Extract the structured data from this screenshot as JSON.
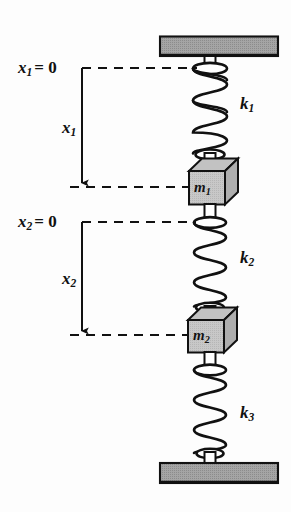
{
  "figure": {
    "colors": {
      "stroke": "#111111",
      "plate_fill": "#9d9d9d",
      "block_front_fill": "#c9c9c9",
      "block_top_fill": "#bdbdbd",
      "block_side_fill": "#a8a8a8",
      "background": "#fdfdfd"
    }
  },
  "labels": {
    "x1_zero": {
      "var": "x",
      "sub": "1",
      "eq": "= 0"
    },
    "x2_zero": {
      "var": "x",
      "sub": "2",
      "eq": "= 0"
    },
    "x1_dim": {
      "var": "x",
      "sub": "1"
    },
    "x2_dim": {
      "var": "x",
      "sub": "2"
    },
    "k1": {
      "var": "k",
      "sub": "1"
    },
    "k2": {
      "var": "k",
      "sub": "2"
    },
    "k3": {
      "var": "k",
      "sub": "3"
    },
    "m1": {
      "var": "m",
      "sub": "1"
    },
    "m2": {
      "var": "m",
      "sub": "2"
    }
  },
  "components": {
    "top_plate": "ceiling-support-plate",
    "bottom_plate": "floor-support-plate",
    "spring_1": "coil-spring-k1",
    "spring_2": "coil-spring-k2",
    "spring_3": "coil-spring-k3",
    "mass_1": "mass-block-m1",
    "mass_2": "mass-block-m2",
    "datum_1": "dashed-datum-line-x1",
    "datum_2": "dashed-datum-line-x2",
    "displacement_arrow_1": "displacement-arrow-x1",
    "displacement_arrow_2": "displacement-arrow-x2"
  },
  "geometry": {
    "spring_axis_x": 210,
    "datum_x1_y": 68,
    "mass1_center_y": 187,
    "datum_x2_y": 222,
    "mass2_center_y": 335,
    "dimension_line_x": 82
  }
}
